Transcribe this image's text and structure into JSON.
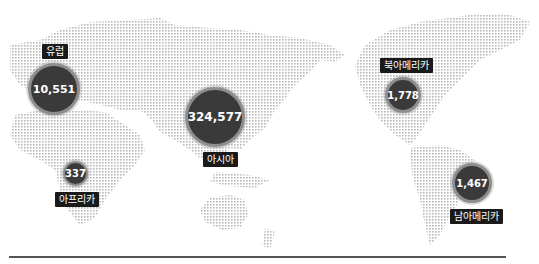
{
  "map": {
    "dot_color": "#bdbdbd",
    "bubble_fill": "#3a3a3a",
    "bubble_ring": "#8e8e8e",
    "label_bg": "#1a1a1a"
  },
  "regions": [
    {
      "name": "유럽",
      "value": "10,551"
    },
    {
      "name": "아시아",
      "value": "324,577"
    },
    {
      "name": "아프리카",
      "value": "337"
    },
    {
      "name": "북아메리카",
      "value": "1,778"
    },
    {
      "name": "남아메리카",
      "value": "1,467"
    }
  ]
}
